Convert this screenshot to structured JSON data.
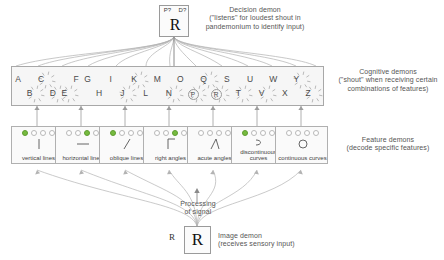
{
  "diagram": {
    "decision_demon": {
      "box_top_left_label": "P?",
      "box_top_right_label": "D?",
      "box_main_letter": "R",
      "annotation_title": "Decision demon",
      "annotation_body": "(\"listens\" for loudest shout in pandemonium to identify input)"
    },
    "cognitive_demons": {
      "annotation_title": "Cognitive demons",
      "annotation_body": "(\"shout\" when receiving certain combinations of features)",
      "letters": [
        {
          "ch": "A",
          "row": "top",
          "shouting": false,
          "circled": false
        },
        {
          "ch": "B",
          "row": "bottom",
          "shouting": true,
          "circled": false
        },
        {
          "ch": "C",
          "row": "top",
          "shouting": true,
          "circled": false
        },
        {
          "ch": "D",
          "row": "bottom",
          "shouting": true,
          "circled": false
        },
        {
          "ch": "E",
          "row": "bottom",
          "shouting": true,
          "circled": false
        },
        {
          "ch": "F",
          "row": "top",
          "shouting": false,
          "circled": false
        },
        {
          "ch": "G",
          "row": "top",
          "shouting": false,
          "circled": false
        },
        {
          "ch": "H",
          "row": "bottom",
          "shouting": false,
          "circled": false
        },
        {
          "ch": "I",
          "row": "top",
          "shouting": false,
          "circled": false
        },
        {
          "ch": "J",
          "row": "bottom",
          "shouting": true,
          "circled": false
        },
        {
          "ch": "K",
          "row": "top",
          "shouting": true,
          "circled": false
        },
        {
          "ch": "L",
          "row": "bottom",
          "shouting": false,
          "circled": false
        },
        {
          "ch": "M",
          "row": "top",
          "shouting": false,
          "circled": false
        },
        {
          "ch": "N",
          "row": "bottom",
          "shouting": true,
          "circled": false
        },
        {
          "ch": "O",
          "row": "top",
          "shouting": false,
          "circled": false
        },
        {
          "ch": "P",
          "row": "bottom",
          "shouting": true,
          "circled": true
        },
        {
          "ch": "Q",
          "row": "top",
          "shouting": true,
          "circled": false
        },
        {
          "ch": "R",
          "row": "bottom",
          "shouting": true,
          "circled": true
        },
        {
          "ch": "S",
          "row": "top",
          "shouting": false,
          "circled": false
        },
        {
          "ch": "T",
          "row": "bottom",
          "shouting": true,
          "circled": false
        },
        {
          "ch": "U",
          "row": "top",
          "shouting": false,
          "circled": false
        },
        {
          "ch": "V",
          "row": "bottom",
          "shouting": true,
          "circled": false
        },
        {
          "ch": "W",
          "row": "top",
          "shouting": false,
          "circled": false
        },
        {
          "ch": "X",
          "row": "bottom",
          "shouting": false,
          "circled": false
        },
        {
          "ch": "Y",
          "row": "top",
          "shouting": true,
          "circled": false
        },
        {
          "ch": "Z",
          "row": "bottom",
          "shouting": true,
          "circled": false
        }
      ]
    },
    "feature_demons": {
      "annotation_title": "Feature demons",
      "annotation_body": "(decode specific features)",
      "active_color": "#76bb3f",
      "boxes": [
        {
          "label": "vertical lines",
          "dots": [
            true,
            false,
            false,
            false
          ],
          "symbol": "vertical"
        },
        {
          "label": "horizontal lines",
          "dots": [
            false,
            false,
            true,
            false
          ],
          "symbol": "horizontal"
        },
        {
          "label": "oblique lines",
          "dots": [
            true,
            false,
            false,
            false
          ],
          "symbol": "oblique"
        },
        {
          "label": "right angles",
          "dots": [
            false,
            false,
            true,
            false
          ],
          "symbol": "right-angle"
        },
        {
          "label": "acute angles",
          "dots": [
            false,
            false,
            false,
            false
          ],
          "symbol": "acute-angle"
        },
        {
          "label": "discontinuous curves",
          "dots": [
            true,
            false,
            false,
            false
          ],
          "symbol": "discontinuous-curve"
        },
        {
          "label": "continuous curves",
          "dots": [
            false,
            false,
            false,
            false
          ],
          "symbol": "continuous-curve"
        }
      ]
    },
    "processing": {
      "line1": "Processing",
      "line2": "of signal"
    },
    "image_demon": {
      "input_letter": "R",
      "box_letter": "R",
      "annotation_title": "Image demon",
      "annotation_body": "(receives sensory input)"
    }
  }
}
